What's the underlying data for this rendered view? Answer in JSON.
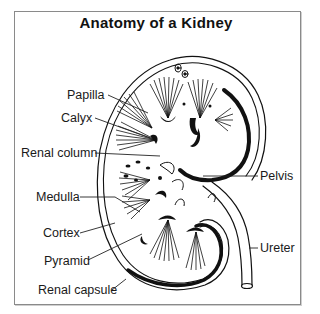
{
  "title": "Anatomy of a Kidney",
  "labels": {
    "papilla": "Papilla",
    "calyx": "Calyx",
    "renal_column": "Renal column",
    "medulla": "Medulla",
    "cortex": "Cortex",
    "pyramid": "Pyramid",
    "renal_capsule": "Renal capsule",
    "pelvis": "Pelvis",
    "ureter": "Ureter"
  },
  "colors": {
    "ink": "#111111",
    "frame": "#8a8a8a",
    "background": "#ffffff"
  }
}
